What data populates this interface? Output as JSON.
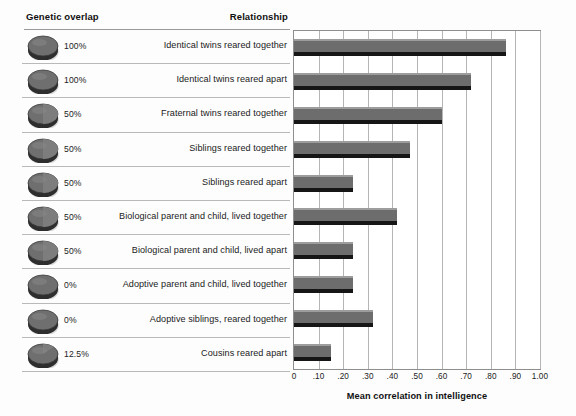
{
  "figure": {
    "background_color": "#fdfdfd",
    "bar_color": "#6d6d6d",
    "bar_highlight_color": "#9d9d9d",
    "bar_shadow_color": "#161616",
    "grid_color": "#b5b5b5",
    "rule_color": "#b9b9b9"
  },
  "table": {
    "header": {
      "genetic_overlap": "Genetic overlap",
      "relationship": "Relationship"
    },
    "rows": [
      {
        "disc_icon": "full-disc-icon",
        "overlap": "100%",
        "relationship": "Identical twins reared together"
      },
      {
        "disc_icon": "full-disc-icon",
        "overlap": "100%",
        "relationship": "Identical twins reared apart"
      },
      {
        "disc_icon": "half-disc-icon",
        "overlap": "50%",
        "relationship": "Fraternal twins reared together"
      },
      {
        "disc_icon": "half-disc-icon",
        "overlap": "50%",
        "relationship": "Siblings reared together"
      },
      {
        "disc_icon": "half-disc-icon",
        "overlap": "50%",
        "relationship": "Siblings reared apart"
      },
      {
        "disc_icon": "half-disc-icon",
        "overlap": "50%",
        "relationship": "Biological parent and child, lived together"
      },
      {
        "disc_icon": "half-disc-icon",
        "overlap": "50%",
        "relationship": "Biological parent and child, lived apart"
      },
      {
        "disc_icon": "empty-disc-icon",
        "overlap": "0%",
        "relationship": "Adoptive parent and child, lived together"
      },
      {
        "disc_icon": "empty-disc-icon",
        "overlap": "0%",
        "relationship": "Adoptive siblings, reared together"
      },
      {
        "disc_icon": "eighth-disc-icon",
        "overlap": "12.5%",
        "relationship": "Cousins reared apart"
      }
    ]
  },
  "chart_data": {
    "type": "bar",
    "orientation": "horizontal",
    "title": "",
    "xlabel": "Mean correlation in intelligence",
    "ylabel": "",
    "xlim": [
      0,
      1.0
    ],
    "grid": true,
    "legend": null,
    "tick_labels": [
      "0",
      ".10",
      ".20",
      ".30",
      ".40",
      ".50",
      ".60",
      ".70",
      ".80",
      ".90",
      "1.00"
    ],
    "tick_values": [
      0,
      0.1,
      0.2,
      0.3,
      0.4,
      0.5,
      0.6,
      0.7,
      0.8,
      0.9,
      1.0
    ],
    "categories": [
      "Identical twins reared together",
      "Identical twins reared apart",
      "Fraternal twins reared together",
      "Siblings reared together",
      "Siblings reared apart",
      "Biological parent and child, lived together",
      "Biological parent and child, lived apart",
      "Adoptive parent and child, lived together",
      "Adoptive siblings, reared together",
      "Cousins reared apart"
    ],
    "values": [
      0.86,
      0.72,
      0.6,
      0.47,
      0.24,
      0.42,
      0.24,
      0.24,
      0.32,
      0.15
    ]
  },
  "axis": {
    "title": "Mean correlation in intelligence"
  }
}
